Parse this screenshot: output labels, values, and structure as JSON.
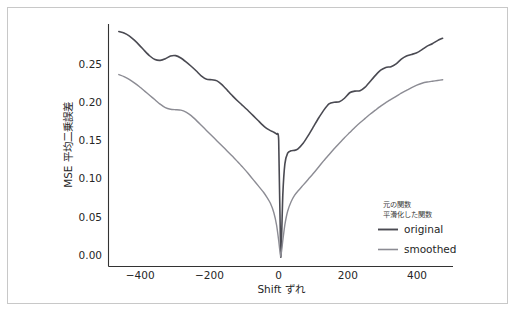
{
  "chart_data": {
    "type": "line",
    "title": "",
    "xlabel": "Shift ずれ",
    "ylabel": "MSE 平均二乗誤差",
    "xlim": [
      -500,
      500
    ],
    "ylim": [
      -0.012,
      0.295
    ],
    "xticks": [
      "−400",
      "−200",
      "0",
      "200",
      "400"
    ],
    "xtick_values": [
      -400,
      -200,
      0,
      200,
      400
    ],
    "yticks": [
      "0.00",
      "0.05",
      "0.10",
      "0.15",
      "0.20",
      "0.25"
    ],
    "ytick_values": [
      0.0,
      0.05,
      0.1,
      0.15,
      0.2,
      0.25
    ],
    "grid": false,
    "legend_position": "lower right",
    "legend_title_lines": [
      "元の関数",
      "平滑化した関数"
    ],
    "series": [
      {
        "name": "original",
        "color": "#4a4a52",
        "width": 1.6,
        "x": [
          -470,
          -455,
          -440,
          -425,
          -410,
          -395,
          -380,
          -365,
          -350,
          -335,
          -320,
          -305,
          -290,
          -275,
          -260,
          -245,
          -230,
          -215,
          -200,
          -185,
          -170,
          -155,
          -140,
          -125,
          -110,
          -95,
          -80,
          -65,
          -50,
          -40,
          -30,
          -20,
          -12,
          -6,
          0,
          6,
          12,
          20,
          30,
          40,
          50,
          65,
          80,
          95,
          110,
          125,
          140,
          155,
          170,
          185,
          200,
          215,
          230,
          245,
          260,
          275,
          290,
          305,
          320,
          335,
          350,
          365,
          380,
          395,
          410,
          425,
          440,
          455,
          470
        ],
        "y": [
          0.2855,
          0.2835,
          0.28,
          0.2745,
          0.268,
          0.261,
          0.2545,
          0.25,
          0.249,
          0.251,
          0.2545,
          0.255,
          0.252,
          0.247,
          0.2415,
          0.2355,
          0.229,
          0.225,
          0.2245,
          0.223,
          0.218,
          0.211,
          0.204,
          0.1975,
          0.1915,
          0.1855,
          0.179,
          0.1725,
          0.166,
          0.1625,
          0.16,
          0.158,
          0.1555,
          0.148,
          0.0,
          0.079,
          0.118,
          0.1315,
          0.1345,
          0.135,
          0.137,
          0.144,
          0.154,
          0.165,
          0.176,
          0.186,
          0.194,
          0.196,
          0.1965,
          0.201,
          0.208,
          0.21,
          0.2105,
          0.215,
          0.2225,
          0.23,
          0.2365,
          0.24,
          0.241,
          0.2445,
          0.2505,
          0.2545,
          0.2565,
          0.2585,
          0.2625,
          0.267,
          0.27,
          0.274,
          0.277
        ]
      },
      {
        "name": "smoothed",
        "color": "#8c8c94",
        "width": 1.4,
        "x": [
          -470,
          -455,
          -440,
          -425,
          -410,
          -395,
          -380,
          -365,
          -350,
          -335,
          -320,
          -305,
          -290,
          -275,
          -260,
          -245,
          -230,
          -215,
          -200,
          -185,
          -170,
          -155,
          -140,
          -125,
          -110,
          -95,
          -80,
          -65,
          -50,
          -40,
          -30,
          -20,
          -12,
          -6,
          0,
          6,
          12,
          20,
          30,
          40,
          50,
          65,
          80,
          95,
          110,
          125,
          140,
          155,
          170,
          185,
          200,
          215,
          230,
          245,
          260,
          275,
          290,
          305,
          320,
          335,
          350,
          365,
          380,
          395,
          410,
          425,
          440,
          455,
          470
        ],
        "y": [
          0.231,
          0.2285,
          0.225,
          0.2205,
          0.2155,
          0.21,
          0.2045,
          0.199,
          0.1935,
          0.189,
          0.187,
          0.1865,
          0.186,
          0.1835,
          0.179,
          0.173,
          0.1665,
          0.16,
          0.1535,
          0.147,
          0.1405,
          0.134,
          0.1275,
          0.1205,
          0.1135,
          0.106,
          0.098,
          0.09,
          0.082,
          0.0755,
          0.068,
          0.056,
          0.04,
          0.021,
          0.0,
          0.021,
          0.041,
          0.058,
          0.07,
          0.078,
          0.0835,
          0.091,
          0.0985,
          0.106,
          0.114,
          0.122,
          0.1295,
          0.137,
          0.144,
          0.151,
          0.1575,
          0.164,
          0.17,
          0.1755,
          0.181,
          0.186,
          0.191,
          0.1955,
          0.1995,
          0.2035,
          0.2075,
          0.211,
          0.2145,
          0.2175,
          0.22,
          0.2215,
          0.2225,
          0.2235,
          0.2245
        ]
      }
    ]
  },
  "legend": {
    "title_line_1": "元の関数",
    "title_line_2": "平滑化した関数",
    "entries": [
      {
        "label": "original",
        "color": "#4a4a52"
      },
      {
        "label": "smoothed",
        "color": "#8c8c94"
      }
    ]
  },
  "axes": {
    "x_label": "Shift ずれ",
    "y_label": "MSE 平均二乗誤差"
  }
}
